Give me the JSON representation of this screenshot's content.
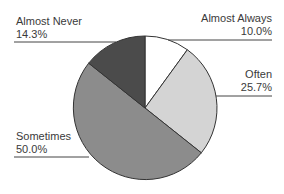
{
  "chart_data": {
    "type": "pie",
    "title": "",
    "categories": [
      "Almost Always",
      "Often",
      "Sometimes",
      "Almost Never"
    ],
    "values": [
      10.0,
      25.7,
      50.0,
      14.3
    ],
    "value_labels": [
      "10.0%",
      "25.7%",
      "50.0%",
      "14.3%"
    ],
    "colors": [
      "#ffffff",
      "#d4d4d4",
      "#8c8c8c",
      "#4b4b4b"
    ],
    "start_angle_deg": 0,
    "direction": "clockwise",
    "legend": "none (leader-line labels)"
  },
  "labels": {
    "almost_always": {
      "name": "Almost Always",
      "pct": "10.0%"
    },
    "often": {
      "name": "Often",
      "pct": "25.7%"
    },
    "sometimes": {
      "name": "Sometimes",
      "pct": "50.0%"
    },
    "almost_never": {
      "name": "Almost Never",
      "pct": "14.3%"
    }
  }
}
